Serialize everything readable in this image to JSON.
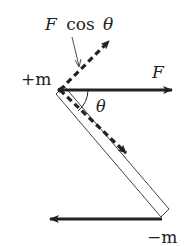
{
  "diagram": {
    "type": "physics-free-body",
    "colors": {
      "ink": "#222222",
      "rod_outline": "#444444",
      "background": "#ffffff"
    },
    "labels": {
      "fcos_F": "F",
      "fcos_cos": "cos",
      "fcos_theta": "θ",
      "plus_m": "+m",
      "force_F": "F",
      "angle": "θ",
      "minus_m": "−m"
    },
    "elements": {
      "rod": {
        "from": [
          60,
          90
        ],
        "to": [
          165,
          213
        ],
        "style": "hollow-bar"
      },
      "force_top": {
        "from": [
          60,
          90
        ],
        "to": [
          172,
          90
        ],
        "style": "solid-arrow",
        "label": "F"
      },
      "force_bottom": {
        "from": [
          162,
          219
        ],
        "to": [
          48,
          219
        ],
        "style": "solid-arrow"
      },
      "component_along_rod": {
        "from": [
          60,
          90
        ],
        "to": [
          126,
          153
        ],
        "style": "dashed-arrow"
      },
      "component_perpendicular": {
        "from": [
          60,
          90
        ],
        "to": [
          110,
          40
        ],
        "style": "dashed-arrow"
      },
      "pointer": {
        "from": [
          72,
          37
        ],
        "to": [
          80,
          68
        ],
        "label": "F cos θ"
      },
      "angle_arc": {
        "center": [
          60,
          90
        ],
        "radius": 28,
        "label": "θ"
      }
    }
  }
}
